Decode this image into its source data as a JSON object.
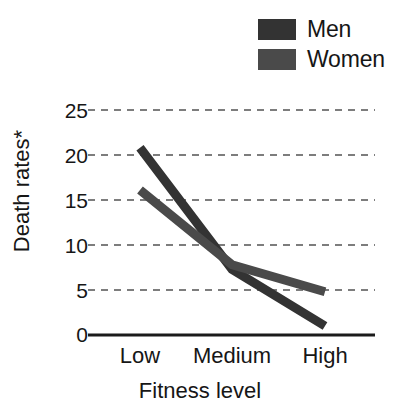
{
  "chart_data": {
    "type": "line",
    "title": "",
    "xlabel": "Fitness level",
    "ylabel": "Death rates*",
    "categories": [
      "Low",
      "Medium",
      "High"
    ],
    "series": [
      {
        "name": "Men",
        "values": [
          20.8,
          7.3,
          1.0
        ],
        "color": "#333333"
      },
      {
        "name": "Women",
        "values": [
          16.1,
          7.8,
          4.8
        ],
        "color": "#4a4a4a"
      }
    ],
    "ylim": [
      0,
      25
    ],
    "yticks": [
      0,
      5,
      10,
      15,
      20,
      25
    ],
    "ytick_labels": [
      "0",
      "5",
      "10",
      "15",
      "20",
      "25"
    ],
    "grid": "horizontal-dashed",
    "legend_position": "top-right",
    "legend_entries": [
      "Men",
      "Women"
    ]
  },
  "legend": {
    "items": [
      {
        "label": "Men",
        "swatch_color": "#333333"
      },
      {
        "label": "Women",
        "swatch_color": "#4a4a4a"
      }
    ]
  },
  "axes": {
    "y_title": "Death rates*",
    "x_title": "Fitness level",
    "y_tick_labels": [
      "25",
      "20",
      "15",
      "10",
      "5",
      "0"
    ],
    "x_tick_labels": [
      "Low",
      "Medium",
      "High"
    ]
  },
  "colors": {
    "axis_line": "#1b1b1b",
    "grid_line": "#7d7d7d",
    "background": "#ffffff",
    "text": "#161616"
  }
}
